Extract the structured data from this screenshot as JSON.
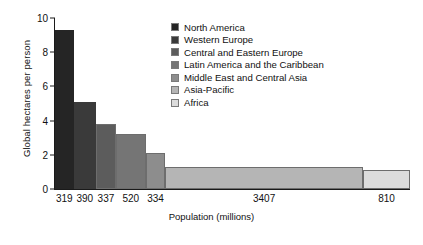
{
  "chart_data": {
    "type": "bar",
    "title": "",
    "subtitle": "",
    "xlabel": "Population (millions)",
    "ylabel": "Global hectares per person",
    "ylim": [
      0,
      10
    ],
    "yticks": [
      0,
      2,
      4,
      6,
      8,
      10
    ],
    "grid": false,
    "legend_position": "top-right-inside",
    "note": "Variable-width bar chart: bar width is proportional to population (millions), bar height is global hectares per person (ecological footprint).",
    "categories": [
      "North America",
      "Western Europe",
      "Central and Eastern Europe",
      "Latin America and the Caribbean",
      "Middle East and Central Asia",
      "Asia-Pacific",
      "Africa"
    ],
    "x": [
      319,
      390,
      337,
      520,
      334,
      3407,
      810
    ],
    "x_tick_labels": [
      "319",
      "390",
      "337",
      "520",
      "334",
      "3407",
      "810"
    ],
    "values": [
      9.3,
      5.1,
      3.8,
      3.2,
      2.1,
      1.3,
      1.1
    ],
    "colors": [
      "#252525",
      "#3a3a3a",
      "#5c5c5c",
      "#757575",
      "#8d8d8d",
      "#b5b5b5",
      "#dcdcdc"
    ],
    "series": [
      {
        "name": "Global hectares per person",
        "values": [
          9.3,
          5.1,
          3.8,
          3.2,
          2.1,
          1.3,
          1.1
        ]
      }
    ],
    "legend": [
      {
        "label": "North America",
        "color": "#252525"
      },
      {
        "label": "Western Europe",
        "color": "#3a3a3a"
      },
      {
        "label": "Central and Eastern Europe",
        "color": "#5c5c5c"
      },
      {
        "label": "Latin America and the Caribbean",
        "color": "#757575"
      },
      {
        "label": "Middle East and Central Asia",
        "color": "#8d8d8d"
      },
      {
        "label": "Asia-Pacific",
        "color": "#b5b5b5"
      },
      {
        "label": "Africa",
        "color": "#dcdcdc"
      }
    ]
  }
}
